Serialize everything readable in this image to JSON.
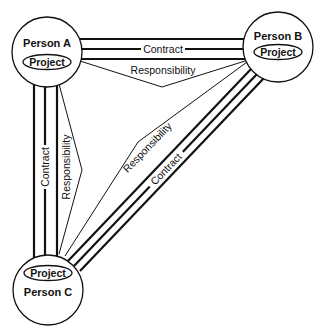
{
  "diagram": {
    "nodes": [
      {
        "id": "A",
        "person": "Person A",
        "project": "Project"
      },
      {
        "id": "B",
        "person": "Person B",
        "project": "Project"
      },
      {
        "id": "C",
        "person": "Person C",
        "project": "Project"
      }
    ],
    "edges": {
      "ab_contract": "Contract",
      "ab_responsibility": "Responsibility",
      "ac_contract": "Contract",
      "ac_responsibility": "Responsibility",
      "bc_contract": "Contract",
      "bc_responsibility": "Responsibility"
    },
    "colors": {
      "stroke": "#111111",
      "background": "#ffffff"
    }
  }
}
